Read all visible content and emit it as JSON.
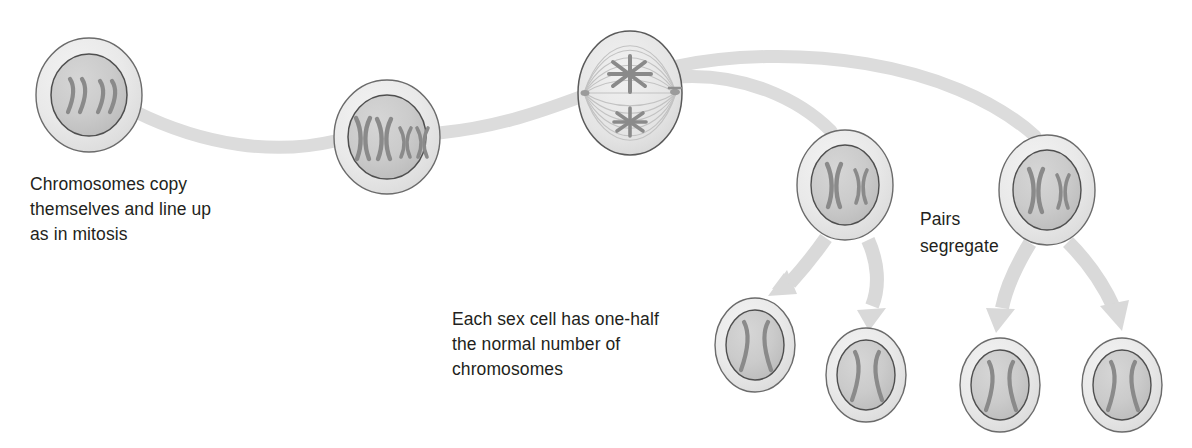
{
  "diagram": {
    "background_color": "#ffffff",
    "palette": {
      "cell_outer_fill": "#e8e8e8",
      "cell_outer_stroke": "#5a5a5a",
      "cell_inner_fill": "#c9c9c9",
      "cell_inner_stroke": "#4f4f4f",
      "chromosome_color": "#8a8a8a",
      "chromosome_dark": "#7d7d7d",
      "connector_color": "#dcdcdc",
      "arrow_color": "#d9d9d9",
      "text_color": "#231f20",
      "spindle_fiber_color": "#bfbfbf"
    },
    "captions": [
      {
        "name": "caption-chromosomes-copy",
        "lines": [
          "Chromosomes copy",
          "themselves and line up",
          "as in mitosis"
        ],
        "x": 30,
        "y": 190
      },
      {
        "name": "caption-each-sex-cell",
        "lines": [
          "Each sex cell has one-half",
          "the normal number of",
          "chromosomes"
        ],
        "x": 452,
        "y": 325
      },
      {
        "name": "caption-pairs-segregate",
        "lines": [
          "Pairs",
          "segregate"
        ],
        "x": 920,
        "y": 225
      }
    ],
    "cells": [
      {
        "name": "cell-interphase",
        "stage": "Chromosomes copied",
        "cx": 89,
        "cy": 95,
        "rx": 53,
        "ry": 57,
        "inner_rx": 38,
        "inner_ry": 41,
        "contents": "four wavy chromosome strands",
        "chromosome_count": 4,
        "glyph": "))  ))"
      },
      {
        "name": "cell-metaphase-aligned",
        "stage": "Chromosomes lined up",
        "cx": 387,
        "cy": 137,
        "rx": 53,
        "ry": 57,
        "inner_rx": 39,
        "inner_ry": 42,
        "contents": "two large X and two small x chromosomes",
        "chromosome_count": 4,
        "glyph": "XXxx"
      },
      {
        "name": "cell-spindle",
        "stage": "Spindle apparatus forms",
        "cx": 630,
        "cy": 93,
        "rx": 52,
        "ry": 62,
        "contents": "spindle fibers with two star-shaped chromosome clusters and centrioles at poles",
        "chromosome_count": 2,
        "glyph": "spindle"
      },
      {
        "name": "cell-daughter-left",
        "stage": "First daughter cell",
        "cx": 845,
        "cy": 185,
        "rx": 48,
        "ry": 55,
        "inner_rx": 34,
        "inner_ry": 40,
        "contents": "one large X and one small x chromosome",
        "chromosome_count": 2,
        "glyph": "X x"
      },
      {
        "name": "cell-daughter-right",
        "stage": "Second daughter cell",
        "cx": 1047,
        "cy": 190,
        "rx": 48,
        "ry": 55,
        "inner_rx": 34,
        "inner_ry": 40,
        "contents": "one large X and one small x chromosome",
        "chromosome_count": 2,
        "glyph": "X x"
      }
    ],
    "gametes": [
      {
        "name": "gamete-1",
        "cx": 755,
        "cy": 345,
        "rx": 40,
        "ry": 47,
        "inner_rx": 29,
        "inner_ry": 35,
        "contents": "two wavy chromatid strands",
        "glyph": ")("
      },
      {
        "name": "gamete-2",
        "cx": 866,
        "cy": 375,
        "rx": 40,
        "ry": 47,
        "inner_rx": 29,
        "inner_ry": 35,
        "contents": "two wavy chromatid strands",
        "glyph": ")("
      },
      {
        "name": "gamete-3",
        "cx": 1000,
        "cy": 385,
        "rx": 40,
        "ry": 47,
        "inner_rx": 29,
        "inner_ry": 35,
        "contents": "two wavy chromatid strands",
        "glyph": ")("
      },
      {
        "name": "gamete-4",
        "cx": 1122,
        "cy": 385,
        "rx": 40,
        "ry": 47,
        "inner_rx": 29,
        "inner_ry": 35,
        "contents": "two wavy chromatid strands",
        "glyph": ")("
      }
    ],
    "connectors": [
      {
        "name": "connector-cell1-to-cell2",
        "from": "cell-interphase",
        "to": "cell-metaphase-aligned"
      },
      {
        "name": "connector-cell2-to-cell3",
        "from": "cell-metaphase-aligned",
        "to": "cell-spindle"
      },
      {
        "name": "connector-cell3-to-daughter-left",
        "from": "cell-spindle",
        "to": "cell-daughter-left"
      },
      {
        "name": "connector-cell3-to-daughter-right",
        "from": "cell-spindle",
        "to": "cell-daughter-right"
      }
    ],
    "arrows": [
      {
        "name": "arrow-daughter-left-to-gamete-1",
        "from": "cell-daughter-left",
        "to": "gamete-1",
        "direction": "down-left"
      },
      {
        "name": "arrow-daughter-left-to-gamete-2",
        "from": "cell-daughter-left",
        "to": "gamete-2",
        "direction": "down"
      },
      {
        "name": "arrow-daughter-right-to-gamete-3",
        "from": "cell-daughter-right",
        "to": "gamete-3",
        "direction": "down-left"
      },
      {
        "name": "arrow-daughter-right-to-gamete-4",
        "from": "cell-daughter-right",
        "to": "gamete-4",
        "direction": "down-right"
      }
    ]
  }
}
